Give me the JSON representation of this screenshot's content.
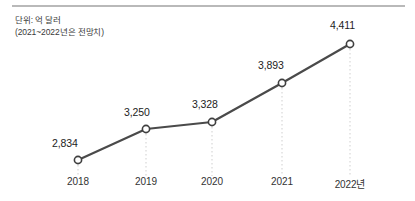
{
  "caption": {
    "line1": "단위: 억 달러",
    "line2": "(2021~2022년은 전망치)"
  },
  "colors": {
    "line": "#4a4a4a",
    "marker_stroke": "#3f3f3f",
    "marker_fill": "#ffffff",
    "dropline": "#cfcfcf",
    "top_rule": "#b9b9b9",
    "text": "#222222"
  },
  "chart_data": {
    "type": "line",
    "title": "",
    "subtitle": "",
    "xlabel": "",
    "ylabel": "단위: 억 달러",
    "annotations": [
      "(2021~2022년은 전망치)"
    ],
    "categories": [
      "2018",
      "2019",
      "2020",
      "2021",
      "2022년"
    ],
    "values": [
      2834,
      3250,
      3328,
      3893,
      4411
    ],
    "point_labels": [
      "2834",
      "3250",
      "3328",
      "3893",
      "4411"
    ],
    "value_labels": [
      "2,834",
      "3,250",
      "3,328",
      "3,893",
      "4,411"
    ],
    "ylim": [
      2600,
      4600
    ],
    "grid": false,
    "legend": null,
    "markers": "open-circle",
    "droplines": true,
    "points": [
      {
        "category": "2018",
        "value": 2834,
        "label": "2,834",
        "px": 78,
        "py": 160
      },
      {
        "category": "2019",
        "value": 3250,
        "label": "3,250",
        "px": 146,
        "py": 129
      },
      {
        "category": "2020",
        "value": 3328,
        "label": "3,328",
        "px": 212,
        "py": 122
      },
      {
        "category": "2021",
        "value": 3893,
        "label": "3,893",
        "px": 282,
        "py": 83
      },
      {
        "category": "2022년",
        "value": 4411,
        "label": "4,411",
        "px": 350,
        "py": 44
      }
    ]
  }
}
